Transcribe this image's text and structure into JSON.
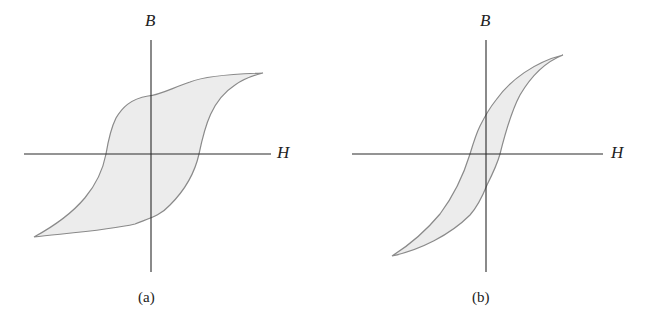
{
  "figure": {
    "panels": [
      {
        "id": "a",
        "caption": "(a)",
        "y_axis_label": "B",
        "x_axis_label": "H",
        "description": "Wide hysteresis loop (high coercivity, high remanence)",
        "colors": {
          "fill": "#ececec",
          "stroke": "#8a8a8a",
          "axis": "#2a2a2a"
        }
      },
      {
        "id": "b",
        "caption": "(b)",
        "y_axis_label": "B",
        "x_axis_label": "H",
        "description": "Narrow hysteresis loop (low coercivity, low remanence)",
        "colors": {
          "fill": "#ececec",
          "stroke": "#8a8a8a",
          "axis": "#2a2a2a"
        }
      }
    ]
  }
}
